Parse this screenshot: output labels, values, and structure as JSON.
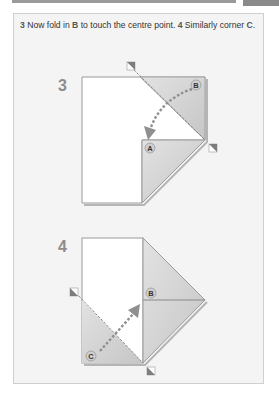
{
  "page": {
    "caption_parts": {
      "step3_num": "3",
      "step3_text_a": " Now fold in ",
      "step3_letter": "B",
      "step3_text_b": " to touch the centre point. ",
      "step4_num": "4",
      "step4_text_a": " Similarly corner ",
      "step4_letter": "C",
      "step4_text_b": "."
    },
    "steps": [
      {
        "number": "3",
        "labels": [
          "A",
          "B"
        ]
      },
      {
        "number": "4",
        "labels": [
          "B",
          "C"
        ]
      }
    ]
  },
  "colors": {
    "paper": "#ffffff",
    "fold_shade": "#d4d4d4",
    "outline": "#9a9a9a",
    "arrow": "#8f8f8f",
    "step_number": "#8c8c8c",
    "panel_bg": "#f4f4f4"
  }
}
